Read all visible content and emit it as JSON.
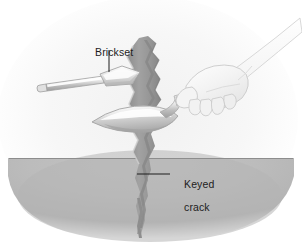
{
  "figure": {
    "kind": "technical-line-illustration",
    "width": 302,
    "height": 242,
    "background_color": "#ffffff"
  },
  "labels": {
    "brickset": "Brickset",
    "keyed_crack_line1": "Keyed",
    "keyed_crack_line2": "crack"
  },
  "colors": {
    "page_background": "#ffffff",
    "vignette_light": "#fbfbfb",
    "vignette_mid": "#f2f2f2",
    "ground_fill": "#b9b9b9",
    "ground_fill_dark": "#a8a8a8",
    "ground_line": "#8f8f8f",
    "crack_fill": "#9c9c9c",
    "crack_fill_dark": "#8a8a8a",
    "crack_edge": "#7d7d7d",
    "tool_light": "#f4f4f4",
    "tool_mid": "#d9d9d9",
    "tool_dark": "#aeaeae",
    "tool_outline": "#9b9b9b",
    "hand_fill": "#f0f0f0",
    "hand_outline": "#c9c9c9",
    "leader_line": "#1d1d1d",
    "text": "#1d1d1d"
  },
  "scene": {
    "ground_line_y": 158,
    "ground_description": "gray elliptical ground plane in lower portion",
    "crack_description": "jagged vertical keyed crack running through masonry",
    "hand_description": "hand gripping tool handle, forearm exiting upper right",
    "blade_description": "pointed leaf-shaped chisel blade driven into crack",
    "inset_tool_description": "brickset chisel with long shaft and wide flared blade"
  },
  "leaders": {
    "brickset": {
      "x1": 109,
      "y1": 50,
      "x2": 109,
      "y2": 72
    },
    "keyed_crack": {
      "x1": 137,
      "y1": 174,
      "x2": 170,
      "y2": 174
    }
  }
}
